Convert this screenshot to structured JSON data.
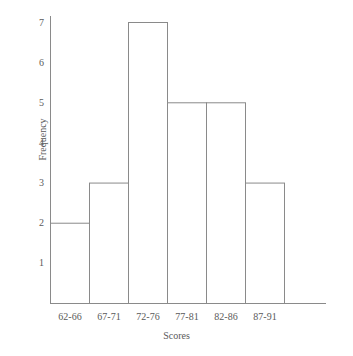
{
  "chart_data": {
    "type": "bar",
    "title": "",
    "subtitle": "",
    "xlabel": "Scores",
    "ylabel": "Frequency",
    "categories": [
      "62-66",
      "67-71",
      "72-76",
      "77-81",
      "82-86",
      "87-91"
    ],
    "values": [
      2,
      3,
      7,
      5,
      5,
      3
    ],
    "ylim": [
      0,
      7
    ],
    "yticks": [
      1,
      2,
      3,
      4,
      5,
      6,
      7
    ],
    "ytick_labels": [
      "1",
      "2",
      "3",
      "4",
      "5",
      "6",
      "7"
    ],
    "xtick_labels": [
      "62-66",
      "67-71",
      "72-76",
      "77-81",
      "82-86",
      "87-91"
    ],
    "grid": false,
    "legend": false,
    "legend_position": "none",
    "bar_fill": "#ffffff",
    "bar_edge_color": "#8a8a8a",
    "axis_color": "#8a8a8a",
    "text_color": "#5a5a5a",
    "background": "#ffffff"
  }
}
